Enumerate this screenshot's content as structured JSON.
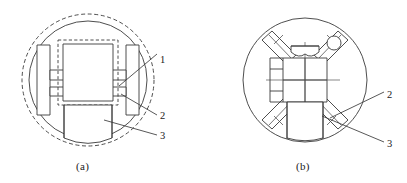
{
  "figure": {
    "type": "technical-line-drawing",
    "panel_count": 2,
    "line_color": "#3a3a3a",
    "background_color": "#ffffff",
    "panels": [
      {
        "id": "a",
        "caption": "(a)",
        "description": "front view: outer dashed circle, inner solid circle, central dashed rectangle enclosing solid block, two side plates with connecting bars, lower block",
        "callouts": [
          {
            "label": "1"
          },
          {
            "label": "2"
          },
          {
            "label": "3"
          }
        ]
      },
      {
        "id": "b",
        "caption": "(b)",
        "description": "plan view: outer circle with four diagonal spoke arms, central square divided in quadrants, small circular hole, cup shaped bracket, lower block",
        "callouts": [
          {
            "label": "2"
          },
          {
            "label": "3"
          }
        ]
      }
    ]
  },
  "panel_a": {
    "caption": "(a)",
    "callout_1": "1",
    "callout_2": "2",
    "callout_3": "3"
  },
  "panel_b": {
    "caption": "(b)",
    "callout_2": "2",
    "callout_3": "3"
  }
}
